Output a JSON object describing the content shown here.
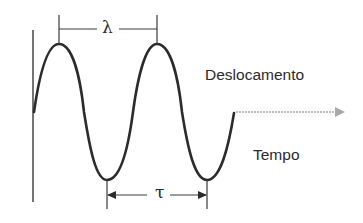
{
  "diagram": {
    "title": "",
    "labels": {
      "displacement": "Deslocamento",
      "time": "Tempo",
      "wavelength_symbol": "λ",
      "period_symbol": "τ"
    },
    "colors": {
      "wave": "#2b2b2b",
      "axis": "#3a3a3a",
      "time_arrow": "#a8a8a8",
      "text": "#2a2a2a"
    },
    "wave": {
      "type": "sine",
      "cycles": 2.25,
      "start": "midline",
      "peaks_x": [
        59,
        157
      ],
      "troughs_x": [
        107,
        207
      ]
    },
    "markers": [
      {
        "name": "wavelength",
        "symbol": "λ",
        "from": "peak 1",
        "to": "peak 2"
      },
      {
        "name": "period",
        "symbol": "τ",
        "from": "trough 1",
        "to": "trough 2",
        "arrows": "both"
      }
    ]
  }
}
